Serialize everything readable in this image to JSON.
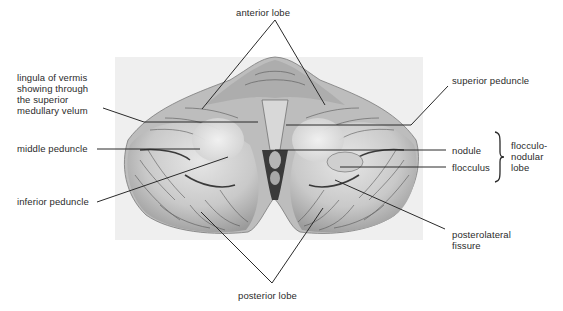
{
  "figure": {
    "background_box_color": "#efefef",
    "line_color": "#2a2a2a"
  },
  "labels": {
    "anterior_lobe": "anterior lobe",
    "lingula": "lingula of vermis\nshowing through\nthe superior\nmedullary velum",
    "middle_peduncle": "middle peduncle",
    "inferior_peduncle": "inferior peduncle",
    "superior_peduncle": "superior peduncle",
    "nodule": "nodule",
    "flocculus": "flocculus",
    "flocculonodular_lobe": "flocculo-\nnodular\nlobe",
    "posterolateral_fissure": "posterolateral\nfissure",
    "posterior_lobe": "posterior lobe"
  }
}
